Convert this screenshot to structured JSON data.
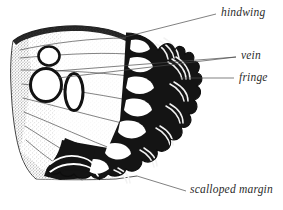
{
  "figure": {
    "subject": "hindwing",
    "style": "black-and-white stipple engraving",
    "background_color": "#ffffff",
    "ink_color": "#1a1a1a",
    "label_color": "#2b2b2b"
  },
  "labels": [
    {
      "id": "hindwing",
      "text": "hindwing",
      "x": 221,
      "y": 7,
      "leader": {
        "from_x": 125,
        "from_y": 37,
        "to_x": 216,
        "to_y": 14
      }
    },
    {
      "id": "vein",
      "text": "vein",
      "x": 241,
      "y": 50,
      "leader": {
        "from_x": 56,
        "from_y": 71,
        "to_x": 236,
        "to_y": 57
      }
    },
    {
      "id": "fringe",
      "text": "fringe",
      "x": 239,
      "y": 72,
      "leader": {
        "from_x": 180,
        "from_y": 78,
        "to_x": 234,
        "to_y": 78
      }
    },
    {
      "id": "scalloped-margin",
      "text": "scalloped margin",
      "x": 190,
      "y": 184,
      "leader": {
        "from_x": 137,
        "from_y": 176,
        "to_x": 186,
        "to_y": 191
      }
    }
  ],
  "anatomy": {
    "eyespots": [
      {
        "name": "upper-small-ocellus",
        "cx": 49,
        "cy": 56,
        "rx": 10,
        "ry": 9
      },
      {
        "name": "large-ocellus",
        "cx": 46,
        "cy": 84,
        "rx": 15,
        "ry": 16
      },
      {
        "name": "elongate-ocellus",
        "cx": 74,
        "cy": 92,
        "rx": 9,
        "ry": 18
      }
    ],
    "marginal_lunule_count": 7,
    "scallop_lobe_count": 7,
    "vein_count": 8
  }
}
